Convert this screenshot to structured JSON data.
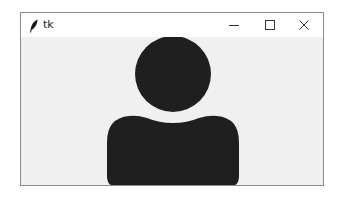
{
  "window": {
    "title": "tk",
    "app_icon": "feather-icon",
    "controls": {
      "minimize": "minimize-icon",
      "maximize": "maximize-icon",
      "close": "close-icon"
    }
  },
  "content": {
    "image": "user-silhouette-icon",
    "colors": {
      "figure": "#1f1f1f",
      "background": "#f0f0f0"
    }
  }
}
